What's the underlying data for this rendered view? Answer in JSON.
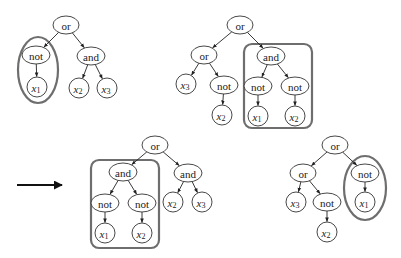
{
  "figure": {
    "arrow": {
      "direction": "right",
      "meaning": "transforms-to"
    },
    "highlight_color": "#6e6e6e",
    "trees": [
      {
        "id": "tree-1",
        "nodes": [
          {
            "id": "a",
            "label": "or",
            "kind": "op"
          },
          {
            "id": "b",
            "label": "not",
            "kind": "op"
          },
          {
            "id": "c",
            "label": "and",
            "kind": "op"
          },
          {
            "id": "d",
            "label": "x",
            "sub": "1",
            "kind": "var"
          },
          {
            "id": "e",
            "label": "x",
            "sub": "2",
            "kind": "var"
          },
          {
            "id": "f",
            "label": "x",
            "sub": "3",
            "kind": "var"
          }
        ],
        "edges": [
          [
            "a",
            "b"
          ],
          [
            "a",
            "c"
          ],
          [
            "b",
            "d"
          ],
          [
            "c",
            "e"
          ],
          [
            "c",
            "f"
          ]
        ],
        "highlight": {
          "shape": "ellipse",
          "nodes": [
            "b",
            "d"
          ]
        }
      },
      {
        "id": "tree-2",
        "nodes": [
          {
            "id": "a",
            "label": "or",
            "kind": "op"
          },
          {
            "id": "b",
            "label": "or",
            "kind": "op"
          },
          {
            "id": "c",
            "label": "and",
            "kind": "op"
          },
          {
            "id": "d",
            "label": "x",
            "sub": "3",
            "kind": "var"
          },
          {
            "id": "e",
            "label": "not",
            "kind": "op"
          },
          {
            "id": "f",
            "label": "x",
            "sub": "2",
            "kind": "var"
          },
          {
            "id": "g",
            "label": "not",
            "kind": "op"
          },
          {
            "id": "h",
            "label": "not",
            "kind": "op"
          },
          {
            "id": "i",
            "label": "x",
            "sub": "1",
            "kind": "var"
          },
          {
            "id": "j",
            "label": "x",
            "sub": "2",
            "kind": "var"
          }
        ],
        "edges": [
          [
            "a",
            "b"
          ],
          [
            "a",
            "c"
          ],
          [
            "b",
            "d"
          ],
          [
            "b",
            "e"
          ],
          [
            "e",
            "f"
          ],
          [
            "c",
            "g"
          ],
          [
            "c",
            "h"
          ],
          [
            "g",
            "i"
          ],
          [
            "h",
            "j"
          ]
        ],
        "highlight": {
          "shape": "rounded-box",
          "nodes": [
            "c",
            "g",
            "h",
            "i",
            "j"
          ]
        }
      },
      {
        "id": "tree-3",
        "nodes": [
          {
            "id": "a",
            "label": "or",
            "kind": "op"
          },
          {
            "id": "b",
            "label": "and",
            "kind": "op"
          },
          {
            "id": "c",
            "label": "and",
            "kind": "op"
          },
          {
            "id": "d",
            "label": "not",
            "kind": "op"
          },
          {
            "id": "e",
            "label": "not",
            "kind": "op"
          },
          {
            "id": "f",
            "label": "x",
            "sub": "1",
            "kind": "var"
          },
          {
            "id": "g",
            "label": "x",
            "sub": "2",
            "kind": "var"
          },
          {
            "id": "h",
            "label": "x",
            "sub": "2",
            "kind": "var"
          },
          {
            "id": "i",
            "label": "x",
            "sub": "3",
            "kind": "var"
          }
        ],
        "edges": [
          [
            "a",
            "b"
          ],
          [
            "a",
            "c"
          ],
          [
            "b",
            "d"
          ],
          [
            "b",
            "e"
          ],
          [
            "d",
            "f"
          ],
          [
            "e",
            "g"
          ],
          [
            "c",
            "h"
          ],
          [
            "c",
            "i"
          ]
        ],
        "highlight": {
          "shape": "rounded-box",
          "nodes": [
            "b",
            "d",
            "e",
            "f",
            "g"
          ]
        }
      },
      {
        "id": "tree-4",
        "nodes": [
          {
            "id": "a",
            "label": "or",
            "kind": "op"
          },
          {
            "id": "b",
            "label": "or",
            "kind": "op"
          },
          {
            "id": "c",
            "label": "not",
            "kind": "op"
          },
          {
            "id": "d",
            "label": "x",
            "sub": "3",
            "kind": "var"
          },
          {
            "id": "e",
            "label": "not",
            "kind": "op"
          },
          {
            "id": "f",
            "label": "x",
            "sub": "2",
            "kind": "var"
          },
          {
            "id": "g",
            "label": "x",
            "sub": "1",
            "kind": "var"
          }
        ],
        "edges": [
          [
            "a",
            "b"
          ],
          [
            "a",
            "c"
          ],
          [
            "b",
            "d"
          ],
          [
            "b",
            "e"
          ],
          [
            "e",
            "f"
          ],
          [
            "c",
            "g"
          ]
        ],
        "highlight": {
          "shape": "ellipse",
          "nodes": [
            "c",
            "g"
          ]
        }
      }
    ]
  }
}
